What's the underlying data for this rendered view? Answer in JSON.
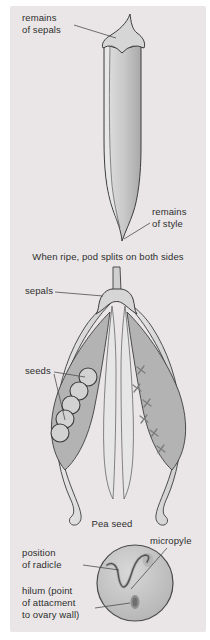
{
  "colors": {
    "panel_bg": "#eae6e7",
    "outline": "#3d3d3d",
    "label_text": "#2e2e2e",
    "pod_dark": "#b3b3b3",
    "seed_circle": "#d2d2d2",
    "pointer_line": "#4d4d4d"
  },
  "figure1": {
    "label_remains_of_sepals": "remains\nof sepals",
    "label_remains_of_style": "remains\nof style"
  },
  "caption_split": "When ripe, pod splits on both sides",
  "figure2": {
    "label_sepals": "sepals",
    "label_seeds": "seeds"
  },
  "figure3": {
    "title": "Pea seed",
    "label_micropyle": "micropyle",
    "label_position_of_radicle": "position\nof radicle",
    "label_hilum": "hilum (point\nof attacment\nto ovary wall)"
  }
}
